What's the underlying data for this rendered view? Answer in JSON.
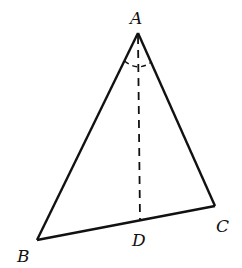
{
  "diagram": {
    "type": "triangle-with-angle-bisector",
    "points": {
      "A": {
        "label": "A",
        "x": 138,
        "y": 33
      },
      "B": {
        "label": "B",
        "x": 37,
        "y": 240
      },
      "C": {
        "label": "C",
        "x": 215,
        "y": 206
      },
      "D": {
        "label": "D",
        "x": 140,
        "y": 221
      }
    },
    "segments": [
      {
        "from": "A",
        "to": "B",
        "style": "solid"
      },
      {
        "from": "A",
        "to": "C",
        "style": "solid"
      },
      {
        "from": "B",
        "to": "C",
        "style": "solid"
      },
      {
        "from": "A",
        "to": "D",
        "style": "dashed"
      }
    ],
    "angle_marks": [
      {
        "vertex": "A",
        "style": "dashed-arc",
        "note": "equal angles BAD and DAC"
      }
    ],
    "colors": {
      "line": "#111111",
      "background": "#ffffff"
    }
  }
}
